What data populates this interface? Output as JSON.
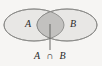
{
  "figure": {
    "type": "venn-diagram",
    "background_color": "#f6f5f3",
    "title": "",
    "sets": [
      {
        "id": "A",
        "label": "A",
        "fill_color": "#e8e7e5",
        "stroke_color": "#8a8a88",
        "center_x": 34,
        "center_y": 25,
        "radius_x": 30,
        "radius_y": 16
      },
      {
        "id": "B",
        "label": "B",
        "fill_color": "#e8e7e5",
        "stroke_color": "#8a8a88",
        "center_x": 67,
        "center_y": 25,
        "radius_x": 30,
        "radius_y": 16
      }
    ],
    "intersection": {
      "label": "A ∩ B",
      "label_left": "A",
      "operator": "∩",
      "label_right": "B",
      "fill_color": "#c2c1bf",
      "stroke_color": "#8a8a88",
      "center_x": 50,
      "center_y": 25,
      "half_width": 4,
      "half_height": 9
    },
    "leader_line": {
      "color": "#5a5a58",
      "x": 50,
      "y_start": 24,
      "y_end": 50
    },
    "caption": {
      "text": "A ∩ B",
      "x": 50,
      "y": 57
    }
  }
}
